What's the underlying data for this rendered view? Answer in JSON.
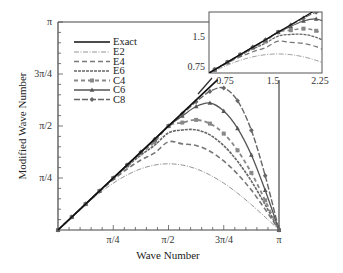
{
  "chart_data": {
    "type": "line",
    "title": "",
    "xlabel": "Wave Number",
    "ylabel": "Modified Wave Number",
    "xlim": [
      0,
      3.14159
    ],
    "ylim": [
      0,
      3.14159
    ],
    "x_ticks": [
      "π/4",
      "π/2",
      "3π/4",
      "π"
    ],
    "y_ticks": [
      "π/4",
      "π/2",
      "3π/4",
      "π"
    ],
    "grid": false,
    "legend_position": "upper-left",
    "x": [
      0,
      0.19635,
      0.3927,
      0.58905,
      0.7854,
      0.98175,
      1.1781,
      1.37445,
      1.5708,
      1.76715,
      1.9635,
      2.15985,
      2.3562,
      2.55255,
      2.7489,
      2.94525,
      3.14159
    ],
    "series": [
      {
        "name": "Exact",
        "style": "solid",
        "values": [
          0,
          0.196,
          0.393,
          0.589,
          0.785,
          0.982,
          1.178,
          1.374,
          1.571,
          1.767,
          1.963,
          2.16,
          2.356,
          2.553,
          2.749,
          2.945,
          3.142
        ]
      },
      {
        "name": "E2",
        "style": "dash-dot",
        "values": [
          0,
          0.195,
          0.383,
          0.556,
          0.707,
          0.831,
          0.924,
          0.981,
          1.0,
          0.981,
          0.924,
          0.831,
          0.707,
          0.556,
          0.383,
          0.195,
          0
        ]
      },
      {
        "name": "E4",
        "style": "dashed",
        "values": [
          0,
          0.196,
          0.392,
          0.582,
          0.76,
          0.921,
          1.057,
          1.164,
          1.333,
          1.301,
          1.277,
          1.19,
          1.043,
          0.844,
          0.603,
          0.311,
          0
        ]
      },
      {
        "name": "E6",
        "style": "dense-dash",
        "values": [
          0,
          0.196,
          0.393,
          0.588,
          0.779,
          0.961,
          1.131,
          1.282,
          1.467,
          1.51,
          1.513,
          1.436,
          1.274,
          1.037,
          0.738,
          0.382,
          0
        ]
      },
      {
        "name": "C4",
        "style": "dashed-square",
        "values": [
          0,
          0.196,
          0.393,
          0.589,
          0.784,
          0.975,
          1.159,
          1.33,
          1.571,
          1.622,
          1.663,
          1.607,
          1.456,
          1.203,
          0.863,
          0.448,
          0
        ]
      },
      {
        "name": "C6",
        "style": "solid-triangle",
        "values": [
          0,
          0.196,
          0.393,
          0.589,
          0.785,
          0.981,
          1.175,
          1.364,
          1.571,
          1.722,
          1.865,
          1.918,
          1.796,
          1.535,
          1.133,
          0.6,
          0
        ]
      },
      {
        "name": "C8",
        "style": "dash-diamond",
        "values": [
          0,
          0.196,
          0.393,
          0.589,
          0.785,
          0.982,
          1.177,
          1.371,
          1.571,
          1.755,
          1.937,
          2.093,
          2.145,
          1.952,
          1.505,
          0.82,
          0
        ]
      }
    ],
    "inset": {
      "xlim": [
        0.5,
        2.25
      ],
      "ylim": [
        0.5,
        2.1
      ],
      "x_ticks": [
        "0.75",
        "1.5",
        "2.25"
      ],
      "y_ticks": [
        "0.75",
        "1.5"
      ]
    }
  },
  "labels": {
    "xlabel": "Wave Number",
    "ylabel": "Modified Wave Number",
    "x_ticks": [
      "π/4",
      "π/2",
      "3π/4",
      "π"
    ],
    "y_ticks": [
      "π/4",
      "π/2",
      "3π/4",
      "π"
    ],
    "inset_x_ticks": [
      "0.75",
      "1.5",
      "2.25"
    ],
    "inset_y_ticks": [
      "0.75",
      "1.5"
    ],
    "legend": [
      "Exact",
      "E2",
      "E4",
      "E6",
      "C4",
      "C6",
      "C8"
    ]
  }
}
